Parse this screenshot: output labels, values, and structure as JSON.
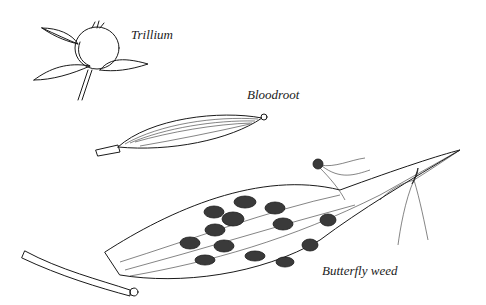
{
  "illustration": {
    "subject": "seed pods",
    "ink_color": "#1a1a1a",
    "background_color": "#ffffff",
    "labels": {
      "trillium": "Trillium",
      "bloodroot": "Bloodroot",
      "butterfly_weed": "Butterfly weed"
    }
  }
}
